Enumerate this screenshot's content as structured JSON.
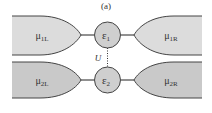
{
  "figure": {
    "panel_label": "(a)",
    "coupling_label": "U",
    "colors": {
      "upper_lead_fill": "#dcdcdc",
      "lower_lead_fill": "#c9c9c9",
      "dot_fill": "#cfcfcf",
      "stroke": "#444444",
      "text": "#333333"
    },
    "dots": [
      {
        "symbol": "ε",
        "subscript": "1"
      },
      {
        "symbol": "ε",
        "subscript": "2"
      }
    ],
    "leads": [
      {
        "symbol": "μ",
        "subscript": "1L"
      },
      {
        "symbol": "μ",
        "subscript": "1R"
      },
      {
        "symbol": "μ",
        "subscript": "2L"
      },
      {
        "symbol": "μ",
        "subscript": "2R"
      }
    ]
  }
}
